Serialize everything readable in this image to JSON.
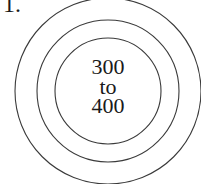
{
  "figure": {
    "label": "1.",
    "center_text": {
      "line1": "300",
      "line2": "to",
      "line3": "400"
    },
    "rings": [
      {
        "name": "outer",
        "r": 93
      },
      {
        "name": "middle",
        "r": 71
      },
      {
        "name": "inner",
        "r": 53
      }
    ],
    "colors": {
      "stroke": "#3a3a3a",
      "text": "#1a1a1a",
      "background": "#ffffff"
    }
  }
}
